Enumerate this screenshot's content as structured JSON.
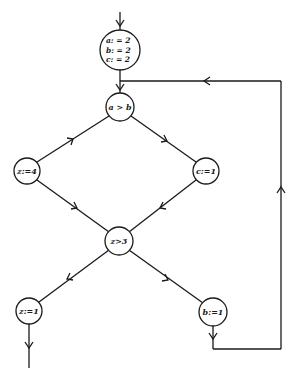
{
  "diagram": {
    "type": "flowchart",
    "nodes": [
      {
        "id": "init",
        "kind": "assignment",
        "lines": [
          "a: = 2",
          "b: = 2",
          "c: = 2"
        ]
      },
      {
        "id": "cond1",
        "kind": "condition",
        "label": "a > b"
      },
      {
        "id": "assignZ4",
        "kind": "assignment",
        "label": "z:=4"
      },
      {
        "id": "assignC1",
        "kind": "assignment",
        "label": "c:=1"
      },
      {
        "id": "cond2",
        "kind": "condition",
        "label": "z>3"
      },
      {
        "id": "assignZ1",
        "kind": "assignment",
        "label": "z:=1"
      },
      {
        "id": "assignB1",
        "kind": "assignment",
        "label": "b:=1"
      }
    ],
    "edges": [
      {
        "from": "entry",
        "to": "init"
      },
      {
        "from": "init",
        "to": "cond1"
      },
      {
        "from": "cond1",
        "to": "assignZ4"
      },
      {
        "from": "cond1",
        "to": "assignC1"
      },
      {
        "from": "assignZ4",
        "to": "cond2"
      },
      {
        "from": "assignC1",
        "to": "cond2"
      },
      {
        "from": "cond2",
        "to": "assignZ1"
      },
      {
        "from": "cond2",
        "to": "assignB1"
      },
      {
        "from": "assignZ1",
        "to": "exit"
      },
      {
        "from": "assignB1",
        "to": "cond1",
        "label": "loop-back"
      }
    ]
  }
}
